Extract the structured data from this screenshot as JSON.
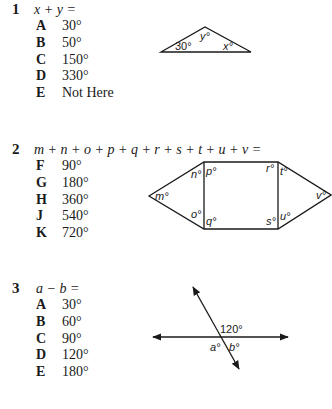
{
  "questions": [
    {
      "number": "1",
      "prompt": "x + y =",
      "choices": [
        {
          "letter": "A",
          "value": "30°"
        },
        {
          "letter": "B",
          "value": "50°"
        },
        {
          "letter": "C",
          "value": "150°"
        },
        {
          "letter": "D",
          "value": "330°"
        },
        {
          "letter": "E",
          "value": "Not Here"
        }
      ],
      "figure": {
        "labels": {
          "angle_left": "30°",
          "angle_top": "y°",
          "angle_right": "x°"
        }
      }
    },
    {
      "number": "2",
      "prompt": "m + n + o + p + q + r + s + t + u + v =",
      "choices": [
        {
          "letter": "F",
          "value": "90°"
        },
        {
          "letter": "G",
          "value": "180°"
        },
        {
          "letter": "H",
          "value": "360°"
        },
        {
          "letter": "J",
          "value": "540°"
        },
        {
          "letter": "K",
          "value": "720°"
        }
      ],
      "figure": {
        "labels": {
          "m": "m°",
          "n": "n°",
          "o": "o°",
          "p": "p°",
          "q": "q°",
          "r": "r°",
          "s": "s°",
          "t": "t°",
          "u": "u°",
          "v": "v°"
        }
      }
    },
    {
      "number": "3",
      "prompt": "a − b =",
      "choices": [
        {
          "letter": "A",
          "value": "30°"
        },
        {
          "letter": "B",
          "value": "60°"
        },
        {
          "letter": "C",
          "value": "90°"
        },
        {
          "letter": "D",
          "value": "120°"
        },
        {
          "letter": "E",
          "value": "180°"
        }
      ],
      "figure": {
        "labels": {
          "given": "120°",
          "a": "a°",
          "b": "b°"
        }
      }
    }
  ]
}
